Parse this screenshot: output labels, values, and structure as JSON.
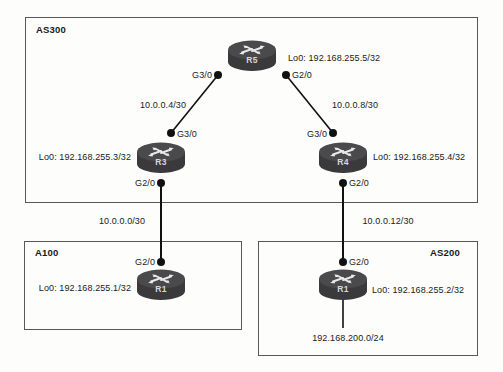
{
  "diagram": {
    "background_color": "#fdfdfc",
    "line_color": "#111111",
    "box_color": "#58585a"
  },
  "as_boxes": [
    {
      "id": "as300",
      "label": "AS300",
      "label_pos": "top-left"
    },
    {
      "id": "a100",
      "label": "A100",
      "label_pos": "top-left"
    },
    {
      "id": "as200",
      "label": "AS200",
      "label_pos": "top-right"
    }
  ],
  "routers": [
    {
      "id": "r5",
      "name": "R5",
      "loopback": "Lo0: 192.168.255.5/32"
    },
    {
      "id": "r3",
      "name": "R3",
      "loopback": "Lo0: 192.168.255.3/32"
    },
    {
      "id": "r4",
      "name": "R4",
      "loopback": "Lo0: 192.168.255.4/32"
    },
    {
      "id": "r1a",
      "name": "R1",
      "loopback": "Lo0: 192.168.255.1/32"
    },
    {
      "id": "r1b",
      "name": "R1",
      "loopback": "Lo0: 192.168.255.2/32"
    }
  ],
  "interfaces": {
    "r5_left": "G3/0",
    "r5_right": "G2/0",
    "r3_top": "G3/0",
    "r3_bottom": "G2/0",
    "r4_top": "G3/0",
    "r4_bottom": "G2/0",
    "r1a_top": "G2/0",
    "r1b_top": "G2/0"
  },
  "links": [
    {
      "id": "r5-r3",
      "subnet": "10.0.0.4/30"
    },
    {
      "id": "r5-r4",
      "subnet": "10.0.0.8/30"
    },
    {
      "id": "r3-r1a",
      "subnet": "10.0.0.0/30"
    },
    {
      "id": "r4-r1b",
      "subnet": "10.0.0.12/30"
    }
  ],
  "stub_networks": [
    {
      "id": "r1b-stub",
      "subnet": "192.168.200.0/24"
    }
  ]
}
